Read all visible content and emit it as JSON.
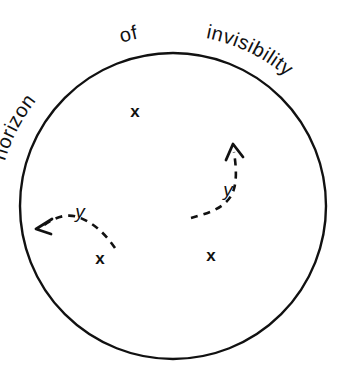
{
  "figure": {
    "title": "horizon of invisibility",
    "background_color": "#ffffff",
    "ink_color": "#111111"
  },
  "boundary": {
    "name": "horizon-of-invisibility-circle",
    "center_x": 173,
    "center_y": 206,
    "radius": 153,
    "stroke_width": 2.4
  },
  "arc_label": {
    "words": [
      {
        "text": "horizon",
        "start_angle": -205,
        "end_angle": -152
      },
      {
        "text": "of",
        "start_angle": -104,
        "end_angle": -86
      },
      {
        "text": "invisibility",
        "start_angle": -58,
        "end_angle": 6
      }
    ],
    "full_text": "horizon of invisibility",
    "font_size": 20,
    "radius": 174
  },
  "marks": [
    {
      "label": "x",
      "x": 135,
      "y": 117,
      "name": "x-mark-upper"
    },
    {
      "label": "x",
      "x": 100,
      "y": 264,
      "name": "x-mark-lower-left"
    },
    {
      "label": "x",
      "x": 211,
      "y": 261,
      "name": "x-mark-lower-right"
    }
  ],
  "trajectories": [
    {
      "name": "dashed-arrow-left",
      "label": "y",
      "label_x": 80,
      "label_y": 218,
      "path": "M 115 248 C 104 232, 92 222, 78 217 C 66 213, 54 218, 44 225",
      "arrow_tip_x": 36,
      "arrow_tip_y": 229,
      "arrow_direction": "down-left",
      "arrowhead": "M 52 219 L 36 229 L 51 234"
    },
    {
      "name": "dashed-arrow-right",
      "label": "y",
      "label_x": 228,
      "label_y": 196,
      "path": "M 191 218 C 205 214, 222 210, 231 196 C 238 184, 236 166, 234 152",
      "arrow_tip_x": 233,
      "arrow_tip_y": 144,
      "arrow_direction": "up",
      "arrowhead": "M 226 160 L 233 144 L 243 157"
    }
  ]
}
